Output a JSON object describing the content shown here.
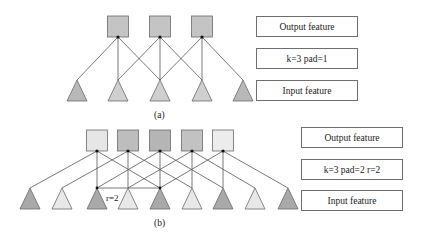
{
  "panel_a": {
    "caption": "(a)",
    "labels": {
      "output": "Output feature",
      "params": "k=3 pad=1",
      "input": "Input feature"
    },
    "outputs": [
      {
        "cx": 118,
        "fill": "#c4c4c4"
      },
      {
        "cx": 160,
        "fill": "#c4c4c4"
      },
      {
        "cx": 202,
        "fill": "#c4c4c4"
      }
    ],
    "inputs": [
      {
        "cx": 77,
        "fill": "#b8b8b8"
      },
      {
        "cx": 118,
        "fill": "#cfcfcf"
      },
      {
        "cx": 160,
        "fill": "#cfcfcf"
      },
      {
        "cx": 202,
        "fill": "#cfcfcf"
      },
      {
        "cx": 243,
        "fill": "#b8b8b8"
      }
    ],
    "kernel_offsets": [
      -1,
      0,
      1
    ]
  },
  "panel_b": {
    "caption": "(b)",
    "dilation_label": "r=2",
    "labels": {
      "output": "Output feature",
      "params": "k=3 pad=2 r=2",
      "input": "Input feature"
    },
    "outputs": [
      {
        "cx": 97,
        "fill": "#e6e6e6"
      },
      {
        "cx": 128,
        "fill": "#bdbdbd"
      },
      {
        "cx": 160,
        "fill": "#b5b5b5"
      },
      {
        "cx": 192,
        "fill": "#c2c2c2"
      },
      {
        "cx": 223,
        "fill": "#ececec"
      }
    ],
    "inputs": [
      {
        "cx": 30,
        "fill": "#a9a9a9"
      },
      {
        "cx": 62,
        "fill": "#e8e8e8"
      },
      {
        "cx": 97,
        "fill": "#a9a9a9"
      },
      {
        "cx": 128,
        "fill": "#e8e8e8"
      },
      {
        "cx": 160,
        "fill": "#a9a9a9"
      },
      {
        "cx": 192,
        "fill": "#e8e8e8"
      },
      {
        "cx": 223,
        "fill": "#a9a9a9"
      },
      {
        "cx": 255,
        "fill": "#e8e8e8"
      },
      {
        "cx": 288,
        "fill": "#a9a9a9"
      }
    ],
    "kernel_offsets": [
      -2,
      0,
      2
    ]
  }
}
